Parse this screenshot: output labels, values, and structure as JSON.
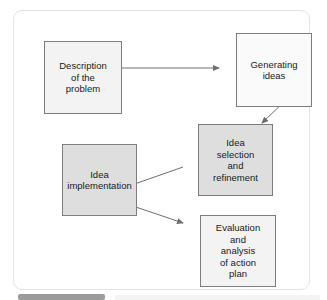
{
  "diagram": {
    "type": "flowchart",
    "boxes": [
      {
        "id": "description",
        "label": "Description\nof the\nproblem",
        "fill": "#f3f3f3",
        "stroke": "#7d7d7d",
        "x": 30,
        "y": 30,
        "w": 78,
        "h": 73
      },
      {
        "id": "generating",
        "label": "Generating\nideas",
        "fill": "#fafafa",
        "stroke": "#7d7d7d",
        "x": 222,
        "y": 22,
        "w": 76,
        "h": 74
      },
      {
        "id": "selection",
        "label": "Idea\nselection\nand\nrefinement",
        "fill": "#dedede",
        "stroke": "#7d7d7d",
        "x": 184,
        "y": 113,
        "w": 75,
        "h": 72
      },
      {
        "id": "implementation",
        "label": "Idea\nimplementation",
        "fill": "#dedede",
        "stroke": "#7d7d7d",
        "x": 48,
        "y": 133,
        "w": 75,
        "h": 72
      },
      {
        "id": "evaluation",
        "label": "Evaluation\nand\nanalysis\nof action\nplan",
        "fill": "#f3f3f3",
        "stroke": "#7d7d7d",
        "x": 186,
        "y": 204,
        "w": 76,
        "h": 72
      }
    ],
    "arrows": [
      {
        "id": "description-to-generating",
        "from": "description",
        "to": "generating",
        "style": "straight-horizontal"
      },
      {
        "id": "generating-to-selection",
        "from": "generating",
        "to": "selection",
        "style": "diagonal-down-left"
      },
      {
        "id": "selection-to-implementation",
        "from": "selection",
        "to": "implementation",
        "style": "diagonal-down-left"
      },
      {
        "id": "implementation-to-evaluation",
        "from": "implementation",
        "to": "evaluation",
        "style": "diagonal-down-right"
      }
    ],
    "colors": {
      "card_background": "#ffffff",
      "card_border": "#e3e3e3",
      "arrow": "#6e6e6e",
      "text": "#1a1a1a"
    }
  }
}
